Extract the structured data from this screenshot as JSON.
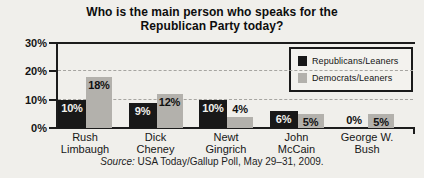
{
  "chart_data": {
    "type": "bar",
    "title": "Who is the main person who speaks for the Republican Party today?",
    "title_lines": [
      "Who is the main person who speaks for the",
      "Republican Party today?"
    ],
    "categories": [
      "Rush Limbaugh",
      "Dick Cheney",
      "Newt Gingrich",
      "John McCain",
      "George W. Bush"
    ],
    "category_label_lines": [
      [
        "Rush",
        "Limbaugh"
      ],
      [
        "Dick",
        "Cheney"
      ],
      [
        "Newt",
        "Gingrich"
      ],
      [
        "John",
        "McCain"
      ],
      [
        "George W.",
        "Bush"
      ]
    ],
    "series": [
      {
        "name": "Republicans/Leaners",
        "color": "#181818",
        "values": [
          10,
          9,
          10,
          6,
          0
        ],
        "value_labels": [
          "10%",
          "9%",
          "10%",
          "6%",
          "0%"
        ]
      },
      {
        "name": "Democrats/Leaners",
        "color": "#b3b1ac",
        "values": [
          18,
          12,
          4,
          5,
          5
        ],
        "value_labels": [
          "18%",
          "12%",
          "4%",
          "5%",
          "5%"
        ]
      }
    ],
    "ylim": [
      0,
      30
    ],
    "ytick_labels": [
      "30%",
      "20%",
      "10%",
      "0%"
    ],
    "ytick_values": [
      30,
      20,
      10,
      0
    ],
    "grid": "horizontal-dashed",
    "gridline_values": [
      20,
      10
    ],
    "legend_position": "top-right",
    "source": {
      "prefix": "Source:",
      "text": "USA Today/Gallup Poll, May 29–31, 2009."
    },
    "colors": {
      "background": "#f0efeb",
      "axis": "#1c1c1c",
      "gridline": "#a6a5a1",
      "bar_label_on_black": "#f2f1ed",
      "bar_label_dark": "#101010"
    }
  }
}
